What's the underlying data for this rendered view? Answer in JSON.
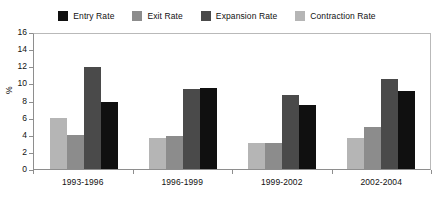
{
  "chart_data": {
    "type": "bar",
    "title": "",
    "subtitle": "",
    "xlabel": "",
    "ylabel": "%",
    "ylim": [
      0,
      16
    ],
    "ytick_step": 2,
    "yticks": [
      "16",
      "14",
      "12",
      "10",
      "8",
      "6",
      "4",
      "2",
      "0"
    ],
    "grid": false,
    "legend_position": "top-center",
    "categories": [
      "1993-1996",
      "1996-1999",
      "1999-2002",
      "2002-2004"
    ],
    "series": [
      {
        "name": "Entry Rate",
        "color": "#101010",
        "values": [
          7.9,
          9.5,
          7.5,
          9.2
        ]
      },
      {
        "name": "Exit Rate",
        "color": "#8c8c8c",
        "values": [
          4.0,
          3.9,
          3.1,
          4.9
        ]
      },
      {
        "name": "Expansion Rate",
        "color": "#4a4a4a",
        "values": [
          12.0,
          9.4,
          8.7,
          10.6
        ]
      },
      {
        "name": "Contraction Rate",
        "color": "#b5b5b5",
        "values": [
          6.0,
          3.6,
          3.1,
          3.7
        ]
      }
    ],
    "bar_draw_order": [
      "Contraction Rate",
      "Exit Rate",
      "Expansion Rate",
      "Entry Rate"
    ]
  },
  "legend": {
    "items": [
      {
        "label": "Entry Rate",
        "color": "#101010"
      },
      {
        "label": "Exit Rate",
        "color": "#8c8c8c"
      },
      {
        "label": "Expansion Rate",
        "color": "#4a4a4a"
      },
      {
        "label": "Contraction Rate",
        "color": "#b5b5b5"
      }
    ]
  },
  "axis": {
    "y_title": "%"
  }
}
